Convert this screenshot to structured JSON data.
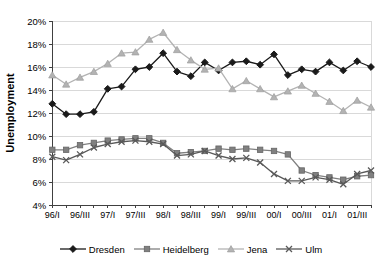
{
  "chart_data": {
    "type": "line",
    "title": "",
    "ylabel": "Unemployment",
    "xlabel": "",
    "ylim": [
      4,
      20
    ],
    "y_tick_step": 2,
    "y_ticks": [
      "4%",
      "6%",
      "8%",
      "10%",
      "12%",
      "14%",
      "16%",
      "18%",
      "20%"
    ],
    "grid": "horizontal",
    "grid_color": "#d9d9d9",
    "axis_color": "#404040",
    "legend_position": "bottom",
    "x_categories": [
      "96/I",
      "96/II",
      "96/III",
      "96/IV",
      "97/I",
      "97/II",
      "97/III",
      "97/IV",
      "98/I",
      "98/II",
      "98/III",
      "98/IV",
      "99/I",
      "99/II",
      "99/III",
      "99/IV",
      "00/I",
      "00/II",
      "00/III",
      "00/IV",
      "01/I",
      "01/II",
      "01/III",
      "01/IV"
    ],
    "x_tick_labels": [
      "96/I",
      "96/III",
      "97/I",
      "97/III",
      "98/I",
      "98/III",
      "99/I",
      "99/III",
      "00/I",
      "00/III",
      "01/I",
      "01/III"
    ],
    "series": [
      {
        "name": "Dresden",
        "marker": "diamond",
        "color": "#1a1a1a",
        "values": [
          12.8,
          11.9,
          11.9,
          12.1,
          14.1,
          14.3,
          15.8,
          16.0,
          17.2,
          15.6,
          15.2,
          16.4,
          15.7,
          16.4,
          16.5,
          16.2,
          17.1,
          15.3,
          15.8,
          15.6,
          16.4,
          15.7,
          16.5,
          16.0
        ]
      },
      {
        "name": "Heidelberg",
        "marker": "square",
        "color": "#808080",
        "values": [
          8.8,
          8.8,
          9.2,
          9.4,
          9.6,
          9.7,
          9.8,
          9.8,
          9.4,
          8.5,
          8.6,
          8.7,
          8.9,
          8.8,
          8.9,
          8.8,
          8.7,
          8.4,
          7.0,
          6.6,
          6.4,
          6.2,
          6.5,
          6.6
        ]
      },
      {
        "name": "Jena",
        "marker": "triangle",
        "color": "#b3b3b3",
        "values": [
          15.3,
          14.5,
          15.1,
          15.6,
          16.3,
          17.2,
          17.3,
          18.4,
          19.0,
          17.5,
          16.6,
          15.8,
          15.9,
          14.1,
          14.8,
          14.1,
          13.4,
          13.9,
          14.4,
          13.7,
          13.0,
          12.2,
          13.1,
          12.5
        ]
      },
      {
        "name": "Ulm",
        "marker": "x",
        "color": "#595959",
        "values": [
          8.2,
          7.9,
          8.4,
          9.0,
          9.3,
          9.5,
          9.6,
          9.5,
          9.3,
          8.3,
          8.4,
          8.7,
          8.3,
          8.0,
          8.1,
          7.7,
          6.7,
          6.1,
          6.1,
          6.4,
          6.2,
          5.8,
          6.7,
          7.0
        ]
      }
    ]
  }
}
